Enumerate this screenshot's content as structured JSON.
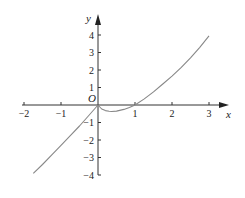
{
  "chart_data": {
    "type": "line",
    "title": "",
    "xlabel": "x",
    "ylabel": "y",
    "origin_label": "O",
    "xlim": [
      -2,
      3
    ],
    "ylim": [
      -4,
      4
    ],
    "x_ticks": [
      -2,
      -1,
      1,
      2,
      3
    ],
    "x_tick_labels": [
      "−2",
      "−1",
      "1",
      "2",
      "3"
    ],
    "y_ticks": [
      4,
      3,
      2,
      1,
      -1,
      -2,
      -3,
      -4
    ],
    "y_tick_labels": [
      "4",
      "3",
      "2",
      "1",
      "−1",
      "−2",
      "−3",
      "−4"
    ],
    "grid": false,
    "series": [
      {
        "name": "f(x)",
        "color": "#888888",
        "x": [
          -1.75,
          -1.5,
          -1.25,
          -1.0,
          -0.75,
          -0.5,
          -0.25,
          0.0,
          0.1,
          0.2,
          0.3,
          0.37,
          0.5,
          0.7,
          0.85,
          1.0,
          1.25,
          1.5,
          1.75,
          2.0,
          2.25,
          2.5,
          2.75,
          3.0
        ],
        "y": [
          -3.9,
          -3.4,
          -2.85,
          -2.3,
          -1.75,
          -1.2,
          -0.6,
          0.0,
          -0.23,
          -0.32,
          -0.36,
          -0.37,
          -0.35,
          -0.25,
          -0.14,
          0.0,
          0.35,
          0.75,
          1.2,
          1.65,
          2.15,
          2.7,
          3.3,
          3.95
        ]
      }
    ]
  }
}
